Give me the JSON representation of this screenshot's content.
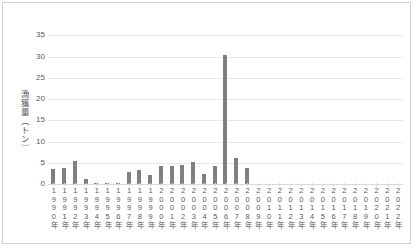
{
  "chart_data": {
    "type": "bar",
    "title": "",
    "xlabel": "",
    "ylabel": "漁獲量（トン）",
    "ylim": [
      0,
      37
    ],
    "yticks": [
      0,
      5,
      10,
      15,
      20,
      25,
      30,
      35
    ],
    "grid": true,
    "legend": false,
    "bar_color": "#808080",
    "gridline_color": "#e8e8e8",
    "categories": [
      "1990年",
      "1991年",
      "1992年",
      "1993年",
      "1994年",
      "1995年",
      "1996年",
      "1997年",
      "1998年",
      "1999年",
      "2000年",
      "2001年",
      "2002年",
      "2003年",
      "2004年",
      "2005年",
      "2006年",
      "2007年",
      "2008年",
      "2009年",
      "2010年",
      "2011年",
      "2012年",
      "2013年",
      "2014年",
      "2015年",
      "2016年",
      "2017年",
      "2018年",
      "2019年",
      "2020年",
      "2021年",
      "2022年"
    ],
    "values": [
      3.5,
      3.7,
      5.4,
      1.1,
      0.1,
      0.15,
      0.3,
      2.8,
      3.2,
      2.1,
      4.3,
      4.3,
      4.5,
      5.1,
      2.3,
      4.3,
      30.3,
      6.1,
      3.7,
      0,
      0,
      0,
      0,
      0,
      0,
      0,
      0,
      0,
      0,
      0,
      0,
      0,
      0
    ]
  }
}
